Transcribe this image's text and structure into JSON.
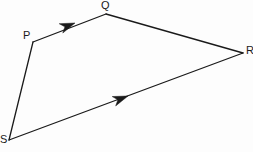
{
  "figure": {
    "name": "quadrilateral-pqrs",
    "background_color": "#fdfdfd",
    "stroke_color": "#1a1a1a",
    "stroke_width": 1.3,
    "width": 253,
    "height": 152,
    "vertices": [
      {
        "id": "P",
        "label": "P",
        "x": 33,
        "y": 42,
        "label_x": 23,
        "label_y": 30
      },
      {
        "id": "Q",
        "label": "Q",
        "x": 106,
        "y": 14,
        "label_x": 101,
        "label_y": 0
      },
      {
        "id": "R",
        "label": "R",
        "x": 243,
        "y": 53,
        "label_x": 246,
        "label_y": 45
      },
      {
        "id": "S",
        "label": "S",
        "x": 9,
        "y": 140,
        "label_x": 0,
        "label_y": 134
      }
    ],
    "edges": [
      {
        "id": "PQ",
        "from": "P",
        "to": "Q",
        "x1": 33,
        "y1": 42,
        "x2": 106,
        "y2": 14,
        "arrow": true
      },
      {
        "id": "QR",
        "from": "Q",
        "to": "R",
        "x1": 106,
        "y1": 14,
        "x2": 243,
        "y2": 53,
        "arrow": false
      },
      {
        "id": "SR",
        "from": "S",
        "to": "R",
        "x1": 9,
        "y1": 140,
        "x2": 243,
        "y2": 53,
        "arrow": true
      },
      {
        "id": "PS",
        "from": "P",
        "to": "S",
        "x1": 33,
        "y1": 42,
        "x2": 9,
        "y2": 140,
        "arrow": false
      }
    ],
    "arrowheads": [
      {
        "id": "arrow-pq",
        "on_edge": "PQ",
        "tip_x": 75,
        "tip_y": 23,
        "angle_deg": -21,
        "length": 15,
        "half_width": 5
      },
      {
        "id": "arrow-sr",
        "on_edge": "SR",
        "tip_x": 128,
        "tip_y": 96,
        "angle_deg": -20.4,
        "length": 15,
        "half_width": 5
      }
    ]
  }
}
